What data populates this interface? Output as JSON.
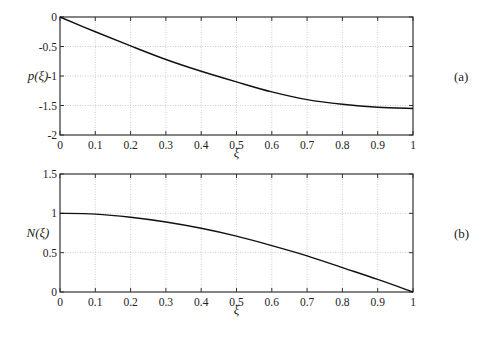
{
  "chart_data": [
    {
      "type": "line",
      "panel_label": "(a)",
      "xlabel": "ξ",
      "ylabel": "p(ξ)",
      "xlim": [
        0,
        1
      ],
      "ylim": [
        -2,
        0
      ],
      "grid": true,
      "x_ticks": [
        "0",
        "0.1",
        "0.2",
        "0.3",
        "0.4",
        "0.5",
        "0.6",
        "0.7",
        "0.8",
        "0.9",
        "1"
      ],
      "y_ticks": [
        "0",
        "-0.5",
        "-1",
        "-1.5",
        "-2"
      ],
      "series": [
        {
          "name": "p(ξ)",
          "x": [
            0,
            0.1,
            0.2,
            0.3,
            0.4,
            0.5,
            0.6,
            0.7,
            0.8,
            0.9,
            1.0
          ],
          "values": [
            0,
            -0.25,
            -0.49,
            -0.72,
            -0.92,
            -1.1,
            -1.27,
            -1.4,
            -1.48,
            -1.53,
            -1.55
          ]
        }
      ]
    },
    {
      "type": "line",
      "panel_label": "(b)",
      "xlabel": "ξ",
      "ylabel": "N(ξ)",
      "xlim": [
        0,
        1
      ],
      "ylim": [
        0,
        1.5
      ],
      "grid": true,
      "x_ticks": [
        "0",
        "0.1",
        "0.2",
        "0.3",
        "0.4",
        "0.5",
        "0.6",
        "0.7",
        "0.8",
        "0.9",
        "1"
      ],
      "y_ticks": [
        "1.5",
        "1",
        "0.5",
        "0"
      ],
      "series": [
        {
          "name": "N(ξ)",
          "x": [
            0,
            0.1,
            0.2,
            0.3,
            0.4,
            0.5,
            0.6,
            0.7,
            0.8,
            0.9,
            1.0
          ],
          "values": [
            1.0,
            0.99,
            0.95,
            0.89,
            0.81,
            0.71,
            0.59,
            0.46,
            0.31,
            0.16,
            0.0
          ]
        }
      ]
    }
  ]
}
